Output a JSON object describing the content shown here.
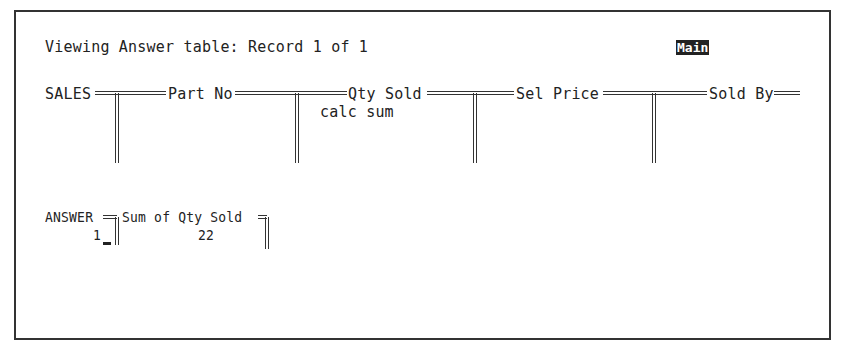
{
  "status": {
    "title": "Viewing Answer table: Record 1 of 1",
    "mode": "Main"
  },
  "query_form": {
    "table_name": "SALES",
    "fields": [
      {
        "label": "Part No",
        "value": ""
      },
      {
        "label": "Qty Sold",
        "value": "calc sum"
      },
      {
        "label": "Sel Price",
        "value": ""
      },
      {
        "label": "Sold By",
        "value": ""
      }
    ]
  },
  "answer_table": {
    "table_name": "ANSWER",
    "columns": [
      "Sum of Qty Sold"
    ],
    "rows": [
      {
        "record": "1",
        "values": [
          "22"
        ]
      }
    ]
  },
  "colors": {
    "foreground": "#222222",
    "background": "#ffffff",
    "mode_highlight_bg": "#222222",
    "mode_highlight_fg": "#ffffff"
  }
}
